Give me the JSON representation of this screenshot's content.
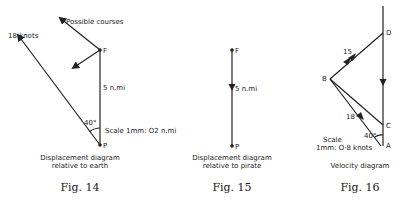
{
  "figures": [
    {
      "id": "fig14",
      "number": "Fig. 14",
      "caption_line1": "Displacement diagram",
      "caption_line2": "relative to earth",
      "labels": {
        "speed": "18 knots",
        "possible": "Possible courses",
        "distance": "5 n.mi",
        "angle": "40°",
        "scale": "Scale 1mm: O2 n.mi",
        "point_f": "F",
        "point_p": "P"
      }
    },
    {
      "id": "fig15",
      "number": "Fig. 15",
      "caption_line1": "Displacement diagram",
      "caption_line2": "relative to pirate",
      "labels": {
        "distance": "5 n.mi",
        "point_f": "F",
        "point_p": "P"
      }
    },
    {
      "id": "fig16",
      "number": "Fig. 16",
      "caption_line1": "Velocity diagram",
      "labels": {
        "speed_15": "15",
        "speed_18": "18",
        "angle": "40°",
        "scale_line1": "Scale",
        "scale_line2": "1mm: O·8 knots",
        "point_d": "D",
        "point_b": "B",
        "point_c": "C",
        "point_a": "A"
      }
    }
  ]
}
